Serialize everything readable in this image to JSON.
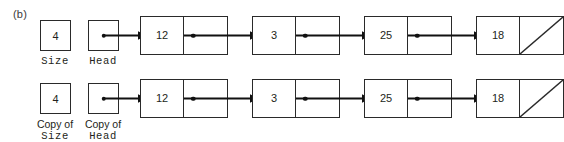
{
  "figure": {
    "panel_label": "(b)",
    "background_color": "#ffffff",
    "ink_color": "#231f20",
    "border_color": "#2a2a2a"
  },
  "rows": [
    {
      "id": "original",
      "size_var": {
        "value": "4",
        "caption_prefix": "",
        "caption_name": "Size"
      },
      "head_var": {
        "value": "",
        "caption_prefix": "",
        "caption_name": "Head"
      },
      "nodes": [
        {
          "data": "12",
          "next": "node-2"
        },
        {
          "data": "3",
          "next": "node-3"
        },
        {
          "data": "25",
          "next": "node-4"
        },
        {
          "data": "18",
          "next": "null"
        }
      ]
    },
    {
      "id": "copy",
      "size_var": {
        "value": "4",
        "caption_prefix": "Copy of",
        "caption_name": "Size"
      },
      "head_var": {
        "value": "",
        "caption_prefix": "Copy of",
        "caption_name": "Head"
      },
      "nodes": [
        {
          "data": "12",
          "next": "node-2"
        },
        {
          "data": "3",
          "next": "node-3"
        },
        {
          "data": "25",
          "next": "node-4"
        },
        {
          "data": "18",
          "next": "null"
        }
      ]
    }
  ]
}
